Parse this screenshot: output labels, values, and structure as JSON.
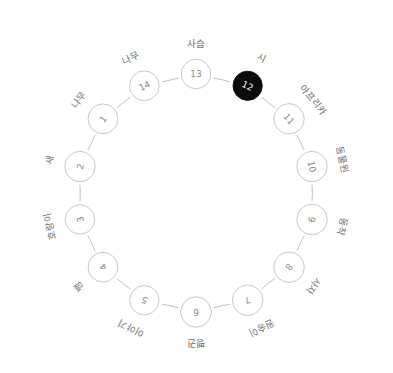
{
  "diagram": {
    "type": "circular-node-graph",
    "title": "",
    "background_color": "#ffffff",
    "node_fill": "#ffffff",
    "node_stroke": "#c2c2c2",
    "node_number_color": "#8a8a8a",
    "label_color": "#6f6f6f",
    "edge_color": "#b9b9b9",
    "active_node_fill": "#0c0c0c",
    "active_node_text": "#ffffff",
    "center_x": 196,
    "center_y": 193,
    "ring_radius": 119,
    "node_radius": 15,
    "label_radius": 150,
    "node_count": 14,
    "active_node_id": "12",
    "nodes": [
      {
        "id": "13",
        "number": "13",
        "label": "사슴",
        "angle": -90,
        "active": false
      },
      {
        "id": "12",
        "number": "12",
        "label": "시",
        "angle": -64.286,
        "active": true
      },
      {
        "id": "11",
        "number": "11",
        "label": "아프리카",
        "angle": -38.571,
        "active": false
      },
      {
        "id": "10",
        "number": "10",
        "label": "동물원",
        "angle": -12.857,
        "active": false
      },
      {
        "id": "9",
        "number": "9",
        "label": "동작",
        "angle": 12.857,
        "active": false
      },
      {
        "id": "8",
        "number": "8",
        "label": "사자",
        "angle": 38.571,
        "active": false
      },
      {
        "id": "7",
        "number": "7",
        "label": "원숭이",
        "angle": 64.286,
        "active": false
      },
      {
        "id": "6",
        "number": "6",
        "label": "펭귄",
        "angle": 90,
        "active": false
      },
      {
        "id": "5",
        "number": "5",
        "label": "이야기",
        "angle": 115.714,
        "active": false
      },
      {
        "id": "4",
        "number": "4",
        "label": "뱀",
        "angle": 141.429,
        "active": false
      },
      {
        "id": "3",
        "number": "3",
        "label": "호랑이",
        "angle": 167.143,
        "active": false
      },
      {
        "id": "2",
        "number": "2",
        "label": "새",
        "angle": 192.857,
        "active": false
      },
      {
        "id": "1",
        "number": "1",
        "label": "나무",
        "angle": 218.571,
        "active": false
      },
      {
        "id": "14",
        "number": "14",
        "label": "나무",
        "angle": 244.286,
        "active": false
      }
    ],
    "edges": [
      {
        "from": "13",
        "to": "12"
      },
      {
        "from": "12",
        "to": "11"
      },
      {
        "from": "11",
        "to": "10"
      },
      {
        "from": "10",
        "to": "9"
      },
      {
        "from": "9",
        "to": "8"
      },
      {
        "from": "8",
        "to": "7"
      },
      {
        "from": "7",
        "to": "6"
      },
      {
        "from": "6",
        "to": "5"
      },
      {
        "from": "5",
        "to": "4"
      },
      {
        "from": "4",
        "to": "3"
      },
      {
        "from": "3",
        "to": "2"
      },
      {
        "from": "2",
        "to": "1"
      },
      {
        "from": "1",
        "to": "14"
      },
      {
        "from": "14",
        "to": "13"
      }
    ]
  }
}
